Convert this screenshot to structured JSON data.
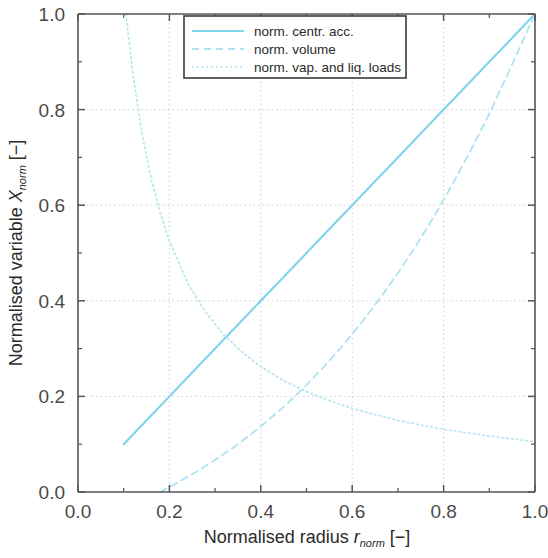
{
  "chart_data": {
    "type": "line",
    "title": "",
    "xlabel_parts": {
      "main": "Normalised radius ",
      "symbol": "r",
      "sub": "norm",
      "unit": " [−]"
    },
    "ylabel_parts": {
      "main": "Normalised variable ",
      "symbol": "X",
      "sub": "norm",
      "unit": " [−]"
    },
    "xlabel": "Normalised radius r_norm [−]",
    "ylabel": "Normalised variable X_norm [−]",
    "xlim": [
      0.0,
      1.0
    ],
    "ylim": [
      0.0,
      1.0
    ],
    "xticks": [
      "0.0",
      "0.2",
      "0.4",
      "0.6",
      "0.8",
      "1.0"
    ],
    "xtick_values": [
      0.0,
      0.2,
      0.4,
      0.6,
      0.8,
      1.0
    ],
    "yticks": [
      "0.0",
      "0.2",
      "0.4",
      "0.6",
      "0.8",
      "1.0"
    ],
    "ytick_values": [
      0.0,
      0.2,
      0.4,
      0.6,
      0.8,
      1.0
    ],
    "minor_ticks": true,
    "grid": true,
    "grid_style": "dotted",
    "legend_position": "top-center",
    "series": [
      {
        "name": "norm. centr. acc.",
        "style": "solid",
        "color": "#7FD4EC",
        "x": [
          0.1,
          0.15,
          0.2,
          0.25,
          0.3,
          0.35,
          0.4,
          0.45,
          0.5,
          0.55,
          0.6,
          0.65,
          0.7,
          0.75,
          0.8,
          0.85,
          0.9,
          0.95,
          1.0
        ],
        "values": [
          0.1,
          0.15,
          0.2,
          0.25,
          0.3,
          0.35,
          0.4,
          0.45,
          0.5,
          0.55,
          0.6,
          0.65,
          0.7,
          0.75,
          0.8,
          0.85,
          0.9,
          0.95,
          1.0
        ]
      },
      {
        "name": "norm. volume",
        "style": "dashed",
        "color": "#AEE3F2",
        "x": [
          0.18,
          0.22,
          0.26,
          0.3,
          0.34,
          0.38,
          0.42,
          0.46,
          0.5,
          0.54,
          0.58,
          0.62,
          0.66,
          0.7,
          0.74,
          0.78,
          0.82,
          0.86,
          0.9,
          0.95,
          1.0
        ],
        "values": [
          0.0,
          0.021,
          0.043,
          0.067,
          0.093,
          0.122,
          0.153,
          0.187,
          0.224,
          0.264,
          0.307,
          0.354,
          0.404,
          0.458,
          0.516,
          0.578,
          0.645,
          0.716,
          0.791,
          0.895,
          1.0
        ]
      },
      {
        "name": "norm. vap. and liq. loads",
        "style": "dotted",
        "color": "#BDE6F3",
        "x": [
          0.105,
          0.12,
          0.14,
          0.16,
          0.18,
          0.2,
          0.24,
          0.28,
          0.32,
          0.36,
          0.4,
          0.45,
          0.5,
          0.55,
          0.6,
          0.65,
          0.7,
          0.75,
          0.8,
          0.85,
          0.9,
          0.95,
          1.0
        ],
        "values": [
          1.0,
          0.875,
          0.75,
          0.656,
          0.583,
          0.525,
          0.437,
          0.375,
          0.328,
          0.292,
          0.262,
          0.233,
          0.21,
          0.191,
          0.175,
          0.162,
          0.15,
          0.14,
          0.131,
          0.124,
          0.117,
          0.111,
          0.105
        ]
      }
    ]
  },
  "legend": {
    "items": [
      {
        "label": "norm. centr. acc.",
        "style": "solid",
        "color": "#7FD4EC"
      },
      {
        "label": "norm. volume",
        "style": "dashed",
        "color": "#AEE3F2"
      },
      {
        "label": "norm. vap. and liq. loads",
        "style": "dotted",
        "color": "#BDE6F3"
      }
    ]
  },
  "colors": {
    "axis": "#555555",
    "grid": "#cfcfcf",
    "background": "#ffffff",
    "text": "#2b2b2b"
  }
}
